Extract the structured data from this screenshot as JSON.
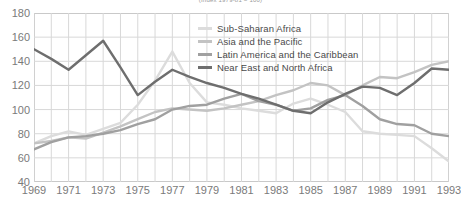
{
  "chart_data": {
    "type": "line",
    "title": "(Index 1979-81 = 100)",
    "xlabel": "",
    "ylabel": "",
    "xlim": [
      1969,
      1993
    ],
    "ylim": [
      40,
      180
    ],
    "yticks": [
      40,
      60,
      80,
      100,
      120,
      140,
      160,
      180
    ],
    "xticks": [
      1969,
      1971,
      1973,
      1975,
      1977,
      1979,
      1981,
      1983,
      1985,
      1987,
      1989,
      1991,
      1993
    ],
    "x": [
      1969,
      1970,
      1971,
      1972,
      1973,
      1974,
      1975,
      1976,
      1977,
      1978,
      1979,
      1980,
      1981,
      1982,
      1983,
      1984,
      1985,
      1986,
      1987,
      1988,
      1989,
      1990,
      1991,
      1992,
      1993
    ],
    "grid": true,
    "legend_position": "upper-center",
    "series": [
      {
        "name": "Sub-Saharan Africa",
        "color": "#dcdcdc",
        "values": [
          72,
          78,
          82,
          79,
          84,
          89,
          104,
          124,
          148,
          122,
          106,
          104,
          101,
          99,
          97,
          105,
          109,
          104,
          98,
          82,
          80,
          79,
          78,
          68,
          57
        ]
      },
      {
        "name": "Asia and the Pacific",
        "color": "#c3c3c3",
        "values": [
          72,
          74,
          77,
          76,
          81,
          86,
          92,
          98,
          101,
          100,
          99,
          101,
          104,
          107,
          112,
          116,
          122,
          120,
          112,
          120,
          127,
          126,
          131,
          137,
          140
        ]
      },
      {
        "name": "Latin America and the Caribbean",
        "color": "#a0a0a0",
        "values": [
          67,
          73,
          77,
          78,
          80,
          83,
          88,
          92,
          100,
          103,
          104,
          109,
          113,
          107,
          104,
          99,
          101,
          108,
          112,
          103,
          92,
          88,
          87,
          80,
          78
        ]
      },
      {
        "name": "Near East and North Africa",
        "color": "#6e6e6e",
        "values": [
          150,
          142,
          133,
          145,
          157,
          135,
          112,
          123,
          133,
          127,
          122,
          118,
          113,
          109,
          104,
          99,
          97,
          106,
          113,
          119,
          118,
          112,
          122,
          134,
          133
        ]
      }
    ]
  }
}
